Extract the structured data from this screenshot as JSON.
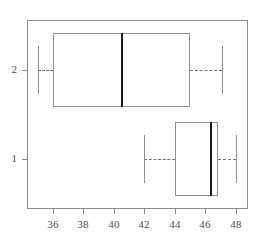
{
  "chart_data": {
    "type": "box",
    "title": "",
    "xlabel": "",
    "ylabel": "",
    "orientation": "horizontal",
    "xlim": [
      34.3,
      48.8
    ],
    "xticks": [
      36,
      38,
      40,
      42,
      44,
      46,
      48
    ],
    "xticklabels": [
      "36",
      "38",
      "40",
      "42",
      "44",
      "46",
      "48"
    ],
    "yticks": [
      1,
      2
    ],
    "yticklabels": [
      "1",
      "2"
    ],
    "grid": false,
    "legend": null,
    "groups": [
      {
        "label": "2",
        "y": 2,
        "whisker_low": 35.0,
        "q1": 36.0,
        "median": 40.5,
        "q3": 45.0,
        "whisker_high": 47.1,
        "outliers": []
      },
      {
        "label": "1",
        "y": 1,
        "whisker_low": 42.0,
        "q1": 44.0,
        "median": 46.3,
        "q3": 46.8,
        "whisker_high": 48.0,
        "outliers": []
      }
    ],
    "colors": {
      "box_edge": "#8f8f8f",
      "median": "#1a1a1a",
      "whisker": "#6e6e6e",
      "frame": "#8a8a8a",
      "tick_label": "#4d4d4d",
      "background": "#ffffff"
    }
  }
}
